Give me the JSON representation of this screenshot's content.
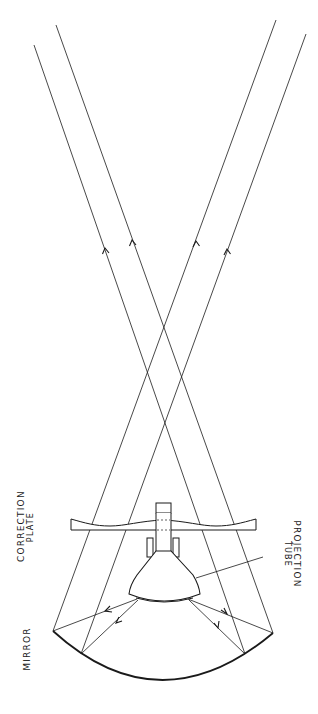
{
  "diagram": {
    "colors": {
      "ink": "#1a1a1a",
      "background": "#ffffff"
    },
    "labels": {
      "correction_plate": {
        "line1": "Correction",
        "line2": "Plate"
      },
      "projection_tube": {
        "line1": "Projection",
        "line2": "Tube"
      },
      "mirror": {
        "line1": "Mirror"
      }
    },
    "components": {
      "mirror": {
        "left_end": [
          53,
          631
        ],
        "right_end": [
          273,
          633
        ],
        "bottom": [
          160,
          680
        ]
      },
      "correction_plate": {
        "x_range": [
          71,
          256
        ],
        "bottom_y": 530,
        "top_y_wavy": [
          519,
          526
        ]
      },
      "tube_neck_top_box": {
        "x": [
          156,
          171
        ],
        "y": [
          503,
          513
        ]
      },
      "yoke_rects": [
        {
          "x": [
            147,
            153
          ],
          "y": [
            538,
            558
          ]
        },
        {
          "x": [
            172,
            178
          ],
          "y": [
            538,
            558
          ]
        }
      ],
      "tube_face": {
        "x": [
          129,
          200
        ],
        "y": [
          594,
          602
        ]
      }
    },
    "rays": [
      {
        "from_tube": [
          137,
          599
        ],
        "mirror_point": [
          53,
          631
        ],
        "exit_end": [
          276,
          20
        ],
        "arrow_down_at": [
          107,
          610
        ],
        "arrow_up_at": [
          196,
          243
        ]
      },
      {
        "from_tube": [
          138,
          600
        ],
        "mirror_point": [
          81,
          654
        ],
        "exit_end": [
          306,
          34
        ],
        "arrow_down_at": [
          117,
          621
        ],
        "arrow_up_at": [
          227,
          251
        ]
      },
      {
        "from_tube": [
          189,
          600
        ],
        "mirror_point": [
          245,
          654
        ],
        "exit_end": [
          34,
          45
        ],
        "arrow_down_at": [
          218,
          627
        ],
        "arrow_up_at": [
          106,
          252
        ]
      },
      {
        "from_tube": [
          188,
          599
        ],
        "mirror_point": [
          273,
          633
        ],
        "exit_end": [
          56,
          25
        ],
        "arrow_down_at": [
          225,
          613
        ],
        "arrow_up_at": [
          133,
          244
        ]
      }
    ]
  }
}
